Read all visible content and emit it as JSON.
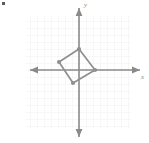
{
  "figure": {
    "width": 149,
    "height": 143,
    "background": "#ffffff"
  },
  "axes": {
    "color": "#8a8a8a",
    "origin_px": {
      "x": 79,
      "y": 70
    },
    "cell_px": 7,
    "x_label": "x",
    "y_label": "y",
    "x_range_units": [
      -7.5,
      9.0
    ],
    "y_range_units": [
      -9.5,
      9.5
    ],
    "grid": {
      "visible": true,
      "color": "#f0eef0",
      "left_px": 26,
      "top_px": 15,
      "right_px": 131,
      "bottom_px": 128
    }
  },
  "chart_data": {
    "type": "scatter",
    "title": "",
    "xlabel": "x",
    "ylabel": "y",
    "grid": true,
    "legend": null,
    "shape_name": "quadrilateral",
    "vertices": [
      {
        "label": "top",
        "x": 0,
        "y": 3,
        "px": 79,
        "py": 49
      },
      {
        "label": "left",
        "x": -3,
        "y": 1,
        "px": 59,
        "py": 62
      },
      {
        "label": "bottom",
        "x": -1,
        "y": -2,
        "px": 73,
        "py": 83
      },
      {
        "label": "right",
        "x": 2,
        "y": 0,
        "px": 95,
        "py": 70
      }
    ],
    "stroke_color": "#8f8f8f",
    "vertex_color": "#8f8f8f",
    "closed": true
  },
  "marks": {
    "corner_artifact": true
  }
}
